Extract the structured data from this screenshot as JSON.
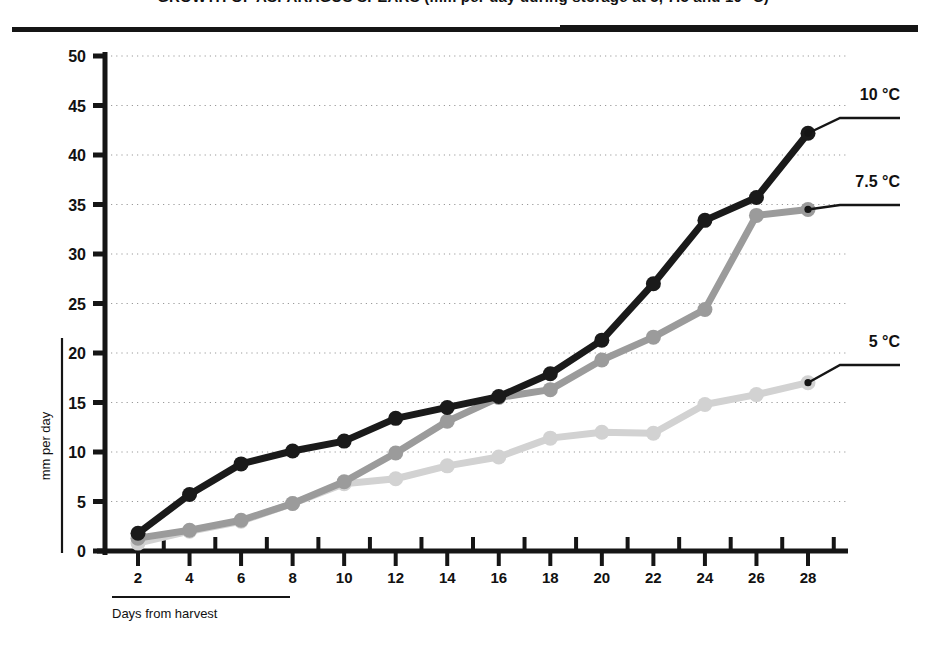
{
  "page": {
    "title_partial": "GROWTH OF ASPARAGUS SPEARS (mm per day during storage at 5, 7.5 and 10 °C)"
  },
  "chart_data": {
    "type": "line",
    "title": "",
    "xlabel": "Days from harvest",
    "ylabel": "mm per day",
    "x": [
      2,
      4,
      6,
      8,
      10,
      12,
      14,
      16,
      18,
      20,
      22,
      24,
      26,
      28
    ],
    "xlim": [
      0,
      29
    ],
    "ylim": [
      0,
      50
    ],
    "xticks": [
      2,
      4,
      6,
      8,
      10,
      12,
      14,
      16,
      18,
      20,
      22,
      24,
      26,
      28
    ],
    "yticks": [
      0,
      5,
      10,
      15,
      20,
      25,
      30,
      35,
      40,
      45,
      50
    ],
    "xtick_labels": [
      "2",
      "4",
      "6",
      "8",
      "10",
      "12",
      "14",
      "16",
      "18",
      "20",
      "22",
      "24",
      "26",
      "28"
    ],
    "ytick_labels": [
      "0",
      "5",
      "10",
      "15",
      "20",
      "25",
      "30",
      "35",
      "40",
      "45",
      "50"
    ],
    "grid": "horizontal-dotted",
    "legend_position": "right-inline-labels",
    "series": [
      {
        "name": "10 °C",
        "color": "#1a1a1a",
        "label_value": "10 °C",
        "values": [
          1.8,
          5.7,
          8.8,
          10.1,
          11.1,
          13.4,
          14.5,
          15.6,
          17.9,
          21.3,
          27.0,
          33.4,
          35.7,
          42.2
        ]
      },
      {
        "name": "7.5 °C",
        "color": "#9b9b9b",
        "label_value": "7.5 °C",
        "values": [
          1.3,
          2.1,
          3.1,
          4.8,
          7.0,
          9.9,
          13.1,
          15.5,
          16.3,
          19.3,
          21.6,
          24.4,
          33.9,
          34.5
        ]
      },
      {
        "name": "5 °C",
        "color": "#d2d2d2",
        "label_value": "5 °C",
        "values": [
          0.8,
          2.0,
          3.0,
          4.8,
          6.8,
          7.3,
          8.6,
          9.5,
          11.4,
          12.0,
          11.9,
          14.8,
          15.8,
          17.0
        ]
      }
    ]
  },
  "colors": {
    "axis": "#151515",
    "grid": "#9a9a9a",
    "background": "#ffffff",
    "series_10c": "#1a1a1a",
    "series_75c": "#9b9b9b",
    "series_5c": "#d2d2d2"
  }
}
